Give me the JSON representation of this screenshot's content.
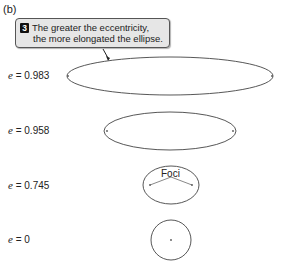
{
  "panel_label": "(b)",
  "callout": {
    "number": "3",
    "line1": "The greater the eccentricity,",
    "line2": "the more elongated the ellipse."
  },
  "ellipses": [
    {
      "e_symbol": "e",
      "e_value": "= 0.983",
      "cx": 170,
      "cy": 76,
      "rx": 103,
      "ry": 19,
      "foci_dx": 102
    },
    {
      "e_symbol": "e",
      "e_value": "= 0.958",
      "cx": 170,
      "cy": 131,
      "rx": 66,
      "ry": 19,
      "foci_dx": 63
    },
    {
      "e_symbol": "e",
      "e_value": "= 0.745",
      "cx": 171,
      "cy": 185,
      "rx": 28,
      "ry": 19,
      "foci_dx": 21
    },
    {
      "e_symbol": "e",
      "e_value": "= 0",
      "cx": 171,
      "cy": 240,
      "rx": 20,
      "ry": 20,
      "foci_dx": 0
    }
  ],
  "foci_label": "Foci"
}
